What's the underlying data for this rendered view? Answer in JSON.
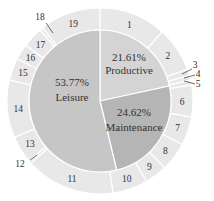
{
  "chart_data": {
    "type": "pie",
    "title": "",
    "inner_ring": [
      {
        "label": "Productive",
        "percent": "21.61%",
        "value": 21.61,
        "color": "#d4d4d4"
      },
      {
        "label": "Maintenance",
        "percent": "24.62%",
        "value": 24.62,
        "color": "#b5b5b5"
      },
      {
        "label": "Leisure",
        "percent": "53.77%",
        "value": 53.77,
        "color": "#c6c6c6"
      }
    ],
    "outer_ring": [
      {
        "label": "1",
        "start": 0,
        "end": 42
      },
      {
        "label": "2",
        "start": 42,
        "end": 70
      },
      {
        "label": "3",
        "start": 70,
        "end": 74
      },
      {
        "label": "4",
        "start": 74,
        "end": 77
      },
      {
        "label": "5",
        "start": 77,
        "end": 80
      },
      {
        "label": "6",
        "start": 80,
        "end": 100
      },
      {
        "label": "7",
        "start": 100,
        "end": 118
      },
      {
        "label": "8",
        "start": 118,
        "end": 136
      },
      {
        "label": "9",
        "start": 136,
        "end": 150
      },
      {
        "label": "10",
        "start": 150,
        "end": 172
      },
      {
        "label": "11",
        "start": 172,
        "end": 228
      },
      {
        "label": "12",
        "start": 228,
        "end": 230
      },
      {
        "label": "13",
        "start": 230,
        "end": 247
      },
      {
        "label": "14",
        "start": 247,
        "end": 283
      },
      {
        "label": "15",
        "start": 283,
        "end": 297
      },
      {
        "label": "16",
        "start": 297,
        "end": 307
      },
      {
        "label": "17",
        "start": 307,
        "end": 320
      },
      {
        "label": "18",
        "start": 320,
        "end": 322
      },
      {
        "label": "19",
        "start": 322,
        "end": 360
      }
    ],
    "outer_color": "#e8e8e8",
    "legend": "none"
  }
}
